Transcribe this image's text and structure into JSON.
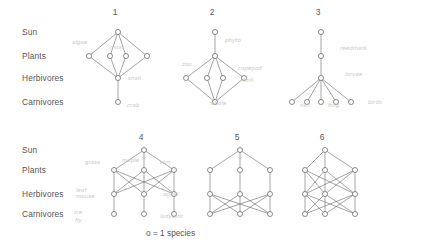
{
  "figure": {
    "caption": "o = 1 species",
    "trophic_levels": [
      {
        "label": "Sun",
        "y_top": 150,
        "y_bottom": 32
      },
      {
        "label": "Plants",
        "y_top": 170,
        "y_bottom": 56
      },
      {
        "label": "Herbivores",
        "y_top": 194,
        "y_bottom": 78
      },
      {
        "label": "Carnivores",
        "y_top": 214,
        "y_bottom": 102
      }
    ],
    "panels": [
      {
        "number": "1",
        "label_x": 115,
        "label_y": 8
      },
      {
        "number": "2",
        "label_x": 212,
        "label_y": 8
      },
      {
        "number": "3",
        "label_x": 318,
        "label_y": 8
      },
      {
        "number": "4",
        "label_x": 141,
        "label_y": 133
      },
      {
        "number": "5",
        "label_x": 237,
        "label_y": 133
      },
      {
        "number": "6",
        "label_x": 322,
        "label_y": 133
      }
    ],
    "annotations": [
      {
        "text": "algae",
        "x": 72,
        "y": 40
      },
      {
        "text": "moss",
        "x": 110,
        "y": 45
      },
      {
        "text": "snail",
        "x": 128,
        "y": 76
      },
      {
        "text": "crab",
        "x": 127,
        "y": 103
      },
      {
        "text": "phyto",
        "x": 225,
        "y": 38
      },
      {
        "text": "zoo",
        "x": 182,
        "y": 62
      },
      {
        "text": "copepod",
        "x": 238,
        "y": 66
      },
      {
        "text": "krill",
        "x": 243,
        "y": 78
      },
      {
        "text": "whale",
        "x": 210,
        "y": 101
      },
      {
        "text": "reedmark",
        "x": 340,
        "y": 46
      },
      {
        "text": "larvae",
        "x": 345,
        "y": 72
      },
      {
        "text": "fish",
        "x": 300,
        "y": 103
      },
      {
        "text": "frog",
        "x": 328,
        "y": 103
      },
      {
        "text": "birds",
        "x": 368,
        "y": 100
      },
      {
        "text": "grass",
        "x": 85,
        "y": 160
      },
      {
        "text": "maple",
        "x": 122,
        "y": 158
      },
      {
        "text": "elm",
        "x": 160,
        "y": 160
      },
      {
        "text": "leaf",
        "x": 76,
        "y": 188
      },
      {
        "text": "mouse",
        "x": 76,
        "y": 194
      },
      {
        "text": "aphid",
        "x": 163,
        "y": 192
      },
      {
        "text": "ice",
        "x": 74,
        "y": 210
      },
      {
        "text": "fly",
        "x": 75,
        "y": 218
      },
      {
        "text": "ladybird",
        "x": 160,
        "y": 214
      }
    ],
    "graphs": [
      {
        "name": "panel-1",
        "nodes": [
          {
            "id": "s",
            "x": 118,
            "y": 32
          },
          {
            "id": "p1",
            "x": 89,
            "y": 56
          },
          {
            "id": "p2",
            "x": 110,
            "y": 56
          },
          {
            "id": "p3",
            "x": 126,
            "y": 56
          },
          {
            "id": "p4",
            "x": 147,
            "y": 56
          },
          {
            "id": "h1",
            "x": 118,
            "y": 78
          },
          {
            "id": "c1",
            "x": 118,
            "y": 102
          }
        ],
        "edges": [
          [
            "s",
            "p1"
          ],
          [
            "s",
            "p2"
          ],
          [
            "s",
            "p3"
          ],
          [
            "s",
            "p4"
          ],
          [
            "p1",
            "h1"
          ],
          [
            "p2",
            "h1"
          ],
          [
            "p3",
            "h1"
          ],
          [
            "p4",
            "h1"
          ],
          [
            "h1",
            "c1"
          ]
        ]
      },
      {
        "name": "panel-2",
        "nodes": [
          {
            "id": "s",
            "x": 215,
            "y": 32
          },
          {
            "id": "p1",
            "x": 215,
            "y": 56
          },
          {
            "id": "h1",
            "x": 186,
            "y": 78
          },
          {
            "id": "h2",
            "x": 207,
            "y": 78
          },
          {
            "id": "h3",
            "x": 223,
            "y": 78
          },
          {
            "id": "h4",
            "x": 244,
            "y": 78
          },
          {
            "id": "c1",
            "x": 215,
            "y": 102
          }
        ],
        "edges": [
          [
            "s",
            "p1"
          ],
          [
            "p1",
            "h1"
          ],
          [
            "p1",
            "h2"
          ],
          [
            "p1",
            "h3"
          ],
          [
            "p1",
            "h4"
          ],
          [
            "h1",
            "c1"
          ],
          [
            "h2",
            "c1"
          ],
          [
            "h3",
            "c1"
          ],
          [
            "h4",
            "c1"
          ]
        ]
      },
      {
        "name": "panel-3",
        "nodes": [
          {
            "id": "s",
            "x": 321,
            "y": 32
          },
          {
            "id": "p1",
            "x": 321,
            "y": 56
          },
          {
            "id": "h1",
            "x": 321,
            "y": 78
          },
          {
            "id": "c1",
            "x": 292,
            "y": 102
          },
          {
            "id": "c2",
            "x": 307,
            "y": 102
          },
          {
            "id": "c3",
            "x": 321,
            "y": 102
          },
          {
            "id": "c4",
            "x": 336,
            "y": 102
          },
          {
            "id": "c5",
            "x": 351,
            "y": 102
          }
        ],
        "edges": [
          [
            "s",
            "p1"
          ],
          [
            "p1",
            "h1"
          ],
          [
            "h1",
            "c1"
          ],
          [
            "h1",
            "c2"
          ],
          [
            "h1",
            "c3"
          ],
          [
            "h1",
            "c4"
          ],
          [
            "h1",
            "c5"
          ]
        ]
      },
      {
        "name": "panel-4",
        "nodes": [
          {
            "id": "s",
            "x": 144,
            "y": 150
          },
          {
            "id": "p1",
            "x": 114,
            "y": 170
          },
          {
            "id": "p2",
            "x": 144,
            "y": 170
          },
          {
            "id": "p3",
            "x": 174,
            "y": 170
          },
          {
            "id": "h1",
            "x": 114,
            "y": 194
          },
          {
            "id": "h2",
            "x": 144,
            "y": 194
          },
          {
            "id": "h3",
            "x": 174,
            "y": 194
          },
          {
            "id": "c1",
            "x": 114,
            "y": 214
          },
          {
            "id": "c2",
            "x": 144,
            "y": 214
          },
          {
            "id": "c3",
            "x": 174,
            "y": 214
          }
        ],
        "edges": [
          [
            "s",
            "p1"
          ],
          [
            "s",
            "p2"
          ],
          [
            "s",
            "p3"
          ],
          [
            "p1",
            "h1"
          ],
          [
            "p1",
            "h2"
          ],
          [
            "p1",
            "h3"
          ],
          [
            "p2",
            "h1"
          ],
          [
            "p2",
            "h2"
          ],
          [
            "p2",
            "h3"
          ],
          [
            "p3",
            "h1"
          ],
          [
            "p3",
            "h2"
          ],
          [
            "p3",
            "h3"
          ],
          [
            "h1",
            "c1"
          ],
          [
            "h2",
            "c2"
          ],
          [
            "h3",
            "c3"
          ]
        ]
      },
      {
        "name": "panel-5",
        "nodes": [
          {
            "id": "s",
            "x": 240,
            "y": 150
          },
          {
            "id": "p1",
            "x": 210,
            "y": 170
          },
          {
            "id": "p2",
            "x": 240,
            "y": 170
          },
          {
            "id": "p3",
            "x": 270,
            "y": 170
          },
          {
            "id": "h1",
            "x": 210,
            "y": 194
          },
          {
            "id": "h2",
            "x": 240,
            "y": 194
          },
          {
            "id": "h3",
            "x": 270,
            "y": 194
          },
          {
            "id": "c1",
            "x": 210,
            "y": 214
          },
          {
            "id": "c2",
            "x": 240,
            "y": 214
          },
          {
            "id": "c3",
            "x": 270,
            "y": 214
          }
        ],
        "edges": [
          [
            "s",
            "p1"
          ],
          [
            "s",
            "p2"
          ],
          [
            "s",
            "p3"
          ],
          [
            "p1",
            "h1"
          ],
          [
            "p2",
            "h2"
          ],
          [
            "p3",
            "h3"
          ],
          [
            "h1",
            "c1"
          ],
          [
            "h1",
            "c2"
          ],
          [
            "h1",
            "c3"
          ],
          [
            "h2",
            "c1"
          ],
          [
            "h2",
            "c2"
          ],
          [
            "h2",
            "c3"
          ],
          [
            "h3",
            "c1"
          ],
          [
            "h3",
            "c2"
          ],
          [
            "h3",
            "c3"
          ]
        ]
      },
      {
        "name": "panel-6",
        "nodes": [
          {
            "id": "s",
            "x": 325,
            "y": 150
          },
          {
            "id": "p1",
            "x": 305,
            "y": 170
          },
          {
            "id": "p2",
            "x": 325,
            "y": 170
          },
          {
            "id": "p3",
            "x": 355,
            "y": 170
          },
          {
            "id": "h1",
            "x": 305,
            "y": 194
          },
          {
            "id": "h2",
            "x": 325,
            "y": 194
          },
          {
            "id": "h3",
            "x": 355,
            "y": 194
          },
          {
            "id": "c1",
            "x": 305,
            "y": 214
          },
          {
            "id": "c2",
            "x": 325,
            "y": 214
          },
          {
            "id": "c3",
            "x": 355,
            "y": 214
          }
        ],
        "edges": [
          [
            "s",
            "p1"
          ],
          [
            "s",
            "p2"
          ],
          [
            "s",
            "p3"
          ],
          [
            "p1",
            "h1"
          ],
          [
            "p1",
            "h2"
          ],
          [
            "p1",
            "h3"
          ],
          [
            "p2",
            "h1"
          ],
          [
            "p2",
            "h2"
          ],
          [
            "p2",
            "h3"
          ],
          [
            "p3",
            "h1"
          ],
          [
            "p3",
            "h2"
          ],
          [
            "p3",
            "h3"
          ],
          [
            "h1",
            "c1"
          ],
          [
            "h1",
            "c2"
          ],
          [
            "h1",
            "c3"
          ],
          [
            "h2",
            "c1"
          ],
          [
            "h2",
            "c2"
          ],
          [
            "h2",
            "c3"
          ],
          [
            "h3",
            "c1"
          ],
          [
            "h3",
            "c2"
          ],
          [
            "h3",
            "c3"
          ]
        ]
      }
    ]
  }
}
